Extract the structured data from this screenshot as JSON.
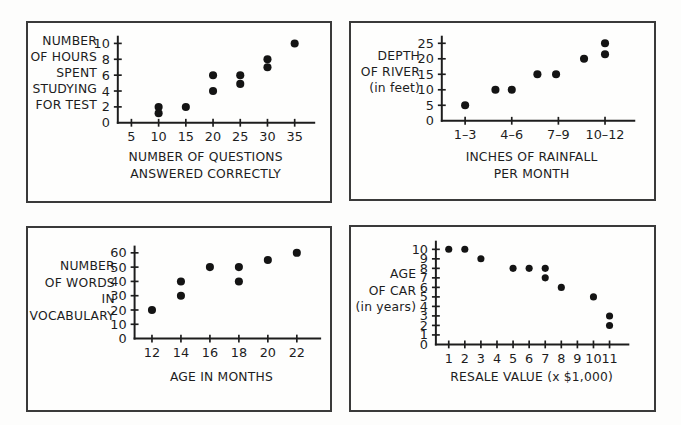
{
  "page": {
    "background": "#fdfdfc",
    "panel_border_color": "#3a3a3a",
    "dot_color": "#141414",
    "panel_count": 4
  },
  "chart_data": [
    {
      "id": "hours-studying-vs-questions",
      "type": "scatter",
      "title": "",
      "ylabel_lines": [
        "NUMBER",
        "OF HOURS",
        "SPENT",
        "STUDYING",
        "FOR TEST"
      ],
      "xlabel_lines": [
        "NUMBER OF QUESTIONS",
        "ANSWERED CORRECTLY"
      ],
      "xlabel": "NUMBER OF QUESTIONS ANSWERED CORRECTLY",
      "ylabel": "NUMBER OF HOURS SPENT STUDYING FOR TEST",
      "xticks": [
        5,
        10,
        15,
        20,
        25,
        30,
        35
      ],
      "xtick_labels": [
        "5",
        "10",
        "15",
        "20",
        "25",
        "30",
        "35"
      ],
      "yticks": [
        0,
        2,
        4,
        6,
        8,
        10
      ],
      "ytick_labels": [
        "0",
        "2",
        "4",
        "6",
        "8",
        "10"
      ],
      "xlim": [
        2.5,
        37.5
      ],
      "ylim": [
        0,
        10.6
      ],
      "grid": false,
      "legend": null,
      "points": [
        {
          "x": 10,
          "y": 2.0
        },
        {
          "x": 10,
          "y": 1.2
        },
        {
          "x": 15,
          "y": 2.0
        },
        {
          "x": 20,
          "y": 6.0
        },
        {
          "x": 20,
          "y": 4.0
        },
        {
          "x": 25,
          "y": 6.0
        },
        {
          "x": 25,
          "y": 4.9
        },
        {
          "x": 30,
          "y": 8.0
        },
        {
          "x": 30,
          "y": 7.0
        },
        {
          "x": 35,
          "y": 10.0
        }
      ]
    },
    {
      "id": "river-depth-vs-rainfall",
      "type": "scatter",
      "title": "",
      "ylabel_lines": [
        "DEPTH",
        "OF RIVER",
        "(in feet)"
      ],
      "xlabel_lines": [
        "INCHES OF RAINFALL",
        "PER MONTH"
      ],
      "xlabel": "INCHES OF RAINFALL PER MONTH",
      "ylabel": "DEPTH OF RIVER (in feet)",
      "xticks": [
        1,
        3,
        5,
        7
      ],
      "xtick_labels": [
        "1–3",
        "4–6",
        "7–9",
        "10–12"
      ],
      "yticks": [
        0,
        5,
        10,
        15,
        20,
        25
      ],
      "ytick_labels": [
        "0",
        "5",
        "10",
        "15",
        "20",
        "25"
      ],
      "xlim": [
        0,
        8
      ],
      "ylim": [
        0,
        26.5
      ],
      "grid": false,
      "legend": null,
      "points": [
        {
          "x": 1.0,
          "y": 5.0
        },
        {
          "x": 2.3,
          "y": 10.0
        },
        {
          "x": 3.0,
          "y": 10.0
        },
        {
          "x": 4.1,
          "y": 15.0
        },
        {
          "x": 4.9,
          "y": 15.0
        },
        {
          "x": 6.1,
          "y": 20.0
        },
        {
          "x": 7.0,
          "y": 25.0
        },
        {
          "x": 7.0,
          "y": 21.5
        }
      ]
    },
    {
      "id": "vocabulary-vs-age",
      "type": "scatter",
      "title": "",
      "ylabel_lines": [
        "NUMBER",
        "OF WORDS",
        "IN",
        "VOCABULARY"
      ],
      "xlabel_lines": [
        "AGE IN MONTHS"
      ],
      "xlabel": "AGE IN MONTHS",
      "ylabel": "NUMBER OF WORDS IN VOCABULARY",
      "xticks": [
        12,
        14,
        16,
        18,
        20,
        22
      ],
      "xtick_labels": [
        "12",
        "14",
        "16",
        "18",
        "20",
        "22"
      ],
      "yticks": [
        0,
        10,
        20,
        30,
        40,
        50,
        60
      ],
      "ytick_labels": [
        "0",
        "10",
        "20",
        "30",
        "40",
        "50",
        "60"
      ],
      "xlim": [
        10.8,
        23.2
      ],
      "ylim": [
        0,
        63
      ],
      "grid": false,
      "legend": null,
      "points": [
        {
          "x": 12,
          "y": 20
        },
        {
          "x": 14,
          "y": 40
        },
        {
          "x": 14,
          "y": 30
        },
        {
          "x": 16,
          "y": 50
        },
        {
          "x": 18,
          "y": 50
        },
        {
          "x": 18,
          "y": 40
        },
        {
          "x": 20,
          "y": 55
        },
        {
          "x": 22,
          "y": 60
        }
      ]
    },
    {
      "id": "car-age-vs-resale-value",
      "type": "scatter",
      "title": "",
      "ylabel_lines": [
        "AGE",
        "OF CAR",
        "(in years)"
      ],
      "xlabel_lines": [
        "RESALE VALUE (x $1,000)"
      ],
      "xlabel": "RESALE VALUE (x $1,000)",
      "ylabel": "AGE OF CAR (in years)",
      "xticks": [
        1,
        2,
        3,
        4,
        5,
        6,
        7,
        8,
        9,
        10,
        11
      ],
      "xtick_labels": [
        "1",
        "2",
        "3",
        "4",
        "5",
        "6",
        "7",
        "8",
        "9",
        "10",
        "11"
      ],
      "yticks": [
        0,
        1,
        2,
        3,
        4,
        5,
        6,
        7,
        8,
        9,
        10
      ],
      "ytick_labels": [
        "0",
        "1",
        "2",
        "3",
        "4",
        "5",
        "6",
        "7",
        "8",
        "9",
        "10"
      ],
      "xlim": [
        0.2,
        11.8
      ],
      "ylim": [
        0,
        10.6
      ],
      "grid": false,
      "legend": null,
      "points": [
        {
          "x": 1,
          "y": 10
        },
        {
          "x": 2,
          "y": 10
        },
        {
          "x": 3,
          "y": 9
        },
        {
          "x": 5,
          "y": 8
        },
        {
          "x": 6,
          "y": 8
        },
        {
          "x": 7,
          "y": 8
        },
        {
          "x": 7,
          "y": 7
        },
        {
          "x": 8,
          "y": 6
        },
        {
          "x": 10,
          "y": 5
        },
        {
          "x": 11,
          "y": 3
        },
        {
          "x": 11,
          "y": 2
        }
      ]
    }
  ]
}
